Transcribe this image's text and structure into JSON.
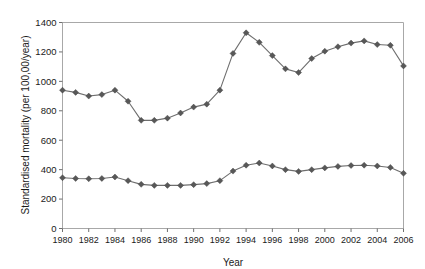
{
  "chart_data": {
    "type": "line",
    "title": "",
    "xlabel": "Year",
    "ylabel": "Standardised mortality (per 100,00/year)",
    "xlim": [
      1980,
      2006
    ],
    "ylim": [
      0,
      1400
    ],
    "ytick_labels": [
      "0",
      "200",
      "400",
      "600",
      "800",
      "1000",
      "1200",
      "1400"
    ],
    "ytick_values": [
      0,
      200,
      400,
      600,
      800,
      1000,
      1200,
      1400
    ],
    "xtick_labels": [
      "1980",
      "1982",
      "1984",
      "1986",
      "1988",
      "1990",
      "1992",
      "1994",
      "1996",
      "1998",
      "2000",
      "2002",
      "2004",
      "2006"
    ],
    "xtick_values": [
      1980,
      1982,
      1984,
      1986,
      1988,
      1990,
      1992,
      1994,
      1996,
      1998,
      2000,
      2002,
      2004,
      2006
    ],
    "grid": false,
    "legend": "none",
    "marker": "diamond",
    "line_color": "#6e6e6e",
    "marker_color": "#585858",
    "x": [
      1980,
      1981,
      1982,
      1983,
      1984,
      1985,
      1986,
      1987,
      1988,
      1989,
      1990,
      1991,
      1992,
      1993,
      1994,
      1995,
      1996,
      1997,
      1998,
      1999,
      2000,
      2001,
      2002,
      2003,
      2004,
      2005,
      2006
    ],
    "series": [
      {
        "name": "upper-series",
        "values": [
          940,
          925,
          900,
          910,
          940,
          865,
          735,
          735,
          750,
          785,
          825,
          845,
          940,
          1190,
          1330,
          1265,
          1175,
          1085,
          1060,
          1155,
          1205,
          1235,
          1260,
          1275,
          1250,
          1245,
          1105
        ]
      },
      {
        "name": "lower-series",
        "values": [
          345,
          340,
          338,
          340,
          350,
          325,
          300,
          293,
          293,
          293,
          298,
          305,
          325,
          390,
          430,
          445,
          425,
          400,
          388,
          400,
          412,
          422,
          428,
          430,
          425,
          415,
          375
        ]
      }
    ]
  }
}
